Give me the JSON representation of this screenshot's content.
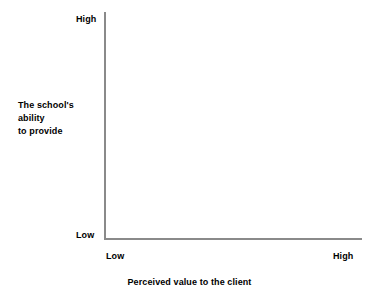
{
  "chart_data": {
    "type": "scatter",
    "title": "",
    "subtitle": "",
    "xlabel": "Perceived value to the client",
    "ylabel": "The school's ability to provide",
    "ylabel_lines": [
      "The school's",
      "ability",
      "to provide"
    ],
    "x_tick_labels": [
      "Low",
      "High"
    ],
    "y_tick_labels": [
      "Low",
      "High"
    ],
    "x_tick_low": "Low",
    "x_tick_high": "High",
    "y_tick_low": "Low",
    "y_tick_high": "High",
    "grid": false,
    "legend": null,
    "series": [],
    "values": [],
    "categories": [],
    "annotations": [],
    "axis_style": "L-shaped open axes, no ticks, empty plotting region",
    "axis_color": "#8a8a8a",
    "text_color": "#000000",
    "background_color": "#ffffff"
  }
}
